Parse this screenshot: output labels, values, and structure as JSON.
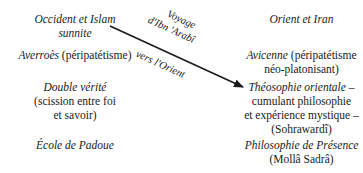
{
  "left_column": {
    "heading": "Occident et Islam",
    "heading_line2": "sunnite",
    "item1_name": "Averroès",
    "item1_detail": "(péripatétisme)",
    "item2_name": "Double vérité",
    "item2_detail_line1": "(scission entre foi",
    "item2_detail_line2": "et savoir)",
    "item3_name": "École de Padoue"
  },
  "right_column": {
    "heading": "Orient et Iran",
    "item1_name": "Avicenne",
    "item1_detail_line1": "(péripatétisme",
    "item1_detail_line2": "néo-platonisant)",
    "item2_name": "Théosophie orientale –",
    "item2_detail_line1": "cumulant philosophie",
    "item2_detail_line2": "et expérience mystique –",
    "item2_detail_line3": "(Sohrawardî)",
    "item3_name": "Philosophie de Présence",
    "item3_detail": "(Mollâ Sadrâ)"
  },
  "arrow": {
    "label_above_line1": "Voyage",
    "label_above_line2": "d'Ibn 'Arabî",
    "label_below": "vers l'Orient",
    "color": "#1a1a1a"
  }
}
